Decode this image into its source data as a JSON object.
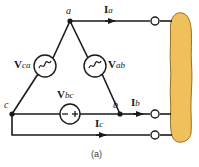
{
  "figure": {
    "caption": "(a)",
    "type": "three-phase delta-connected source circuit diagram",
    "colors": {
      "wire": "#1a1a1a",
      "load_fill": "#efc05c",
      "load_stroke": "#9a7020",
      "text": "#1a1a1a"
    }
  },
  "nodes": [
    {
      "id": "a",
      "label": "a",
      "x": 70,
      "y": 21
    },
    {
      "id": "b",
      "label": "b",
      "x": 120,
      "y": 114
    },
    {
      "id": "c",
      "label": "c",
      "x": 12,
      "y": 114
    }
  ],
  "sources": [
    {
      "id": "Vca",
      "name": "V",
      "sub": "ca",
      "symbol": "ac-sine",
      "cx": 45,
      "cy": 66
    },
    {
      "id": "Vab",
      "name": "V",
      "sub": "ab",
      "symbol": "ac-sine",
      "cx": 95,
      "cy": 66
    },
    {
      "id": "Vbc",
      "name": "V",
      "sub": "bc",
      "symbol": "polarity-minus-plus",
      "cx": 70,
      "cy": 114
    }
  ],
  "currents": [
    {
      "id": "Ia",
      "name": "I",
      "sub": "a",
      "line_y": 21,
      "arrow_x": 113
    },
    {
      "id": "Ib",
      "name": "I",
      "sub": "b",
      "line_y": 114,
      "arrow_x": 141
    },
    {
      "id": "Ic",
      "name": "I",
      "sub": "c",
      "line_y": 135,
      "arrow_x": 104
    }
  ],
  "terminals": [
    {
      "id": "terminal-a",
      "x": 155,
      "y": 21
    },
    {
      "id": "terminal-b",
      "x": 155,
      "y": 114
    },
    {
      "id": "terminal-c",
      "x": 155,
      "y": 135
    }
  ],
  "load": {
    "id": "load-blob",
    "label": "",
    "x": 169,
    "y": 13,
    "width": 24,
    "height": 130
  }
}
